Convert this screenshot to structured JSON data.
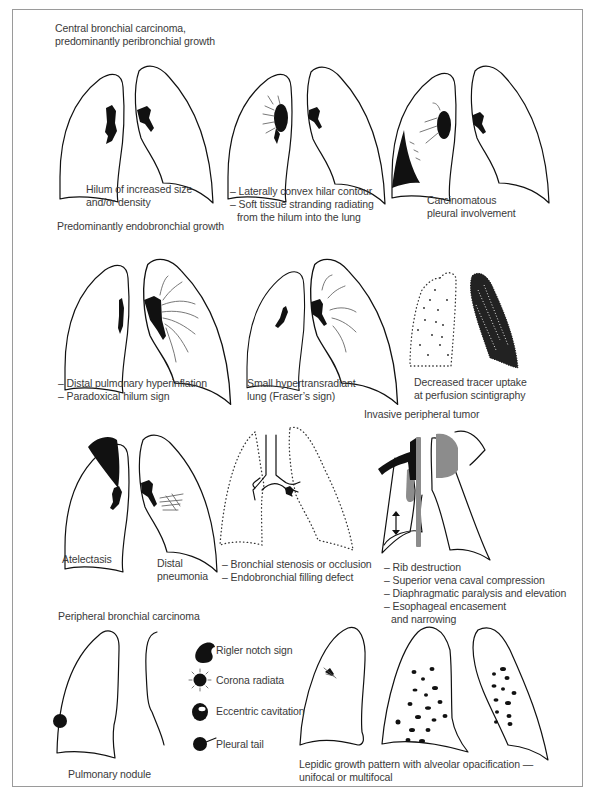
{
  "figure": {
    "sections": {
      "central_title_1": "Central bronchial carcinoma,",
      "central_title_2": "predominantly peribronchial growth",
      "endobronchial_title": "Predominantly endobronchial growth",
      "peripheral_title": "Peripheral bronchial carcinoma",
      "invasive_title": "Invasive peripheral tumor"
    },
    "panels": {
      "hilum": [
        "Hilum of increased size",
        "and/or density"
      ],
      "hilar_contour": [
        "– Laterally convex hilar contour",
        "– Soft tissue stranding radiating",
        "  from the hilum into the lung"
      ],
      "pleural": [
        "Carcinomatous",
        "pleural involvement"
      ],
      "hyperinflation": [
        "– Distal pulmonary hyperinflation",
        "– Paradoxical hilum sign"
      ],
      "fraser": [
        "Small hypertransradiant",
        "lung (Fraser’s sign)"
      ],
      "scintigraphy": [
        "Decreased tracer uptake",
        "at perfusion scintigraphy"
      ],
      "atelectasis": "Atelectasis",
      "pneumonia": [
        "Distal",
        "pneumonia"
      ],
      "bronchial": [
        "– Bronchial stenosis or occlusion",
        "– Endobronchial filling defect"
      ],
      "invasive": [
        "– Rib destruction",
        "– Superior vena caval compression",
        "– Diaphragmatic paralysis and elevation",
        "– Esophageal encasement",
        "  and narrowing"
      ],
      "nodule": "Pulmonary nodule",
      "nodule_signs": [
        "Rigler notch sign",
        "Corona radiata",
        "Eccentric cavitation",
        "Pleural tail"
      ],
      "lepidic": [
        "Lepidic growth pattern with alveolar opacification —",
        "unifocal or multifocal"
      ]
    },
    "colors": {
      "ink": "#111111",
      "tumor_gray": "#8c8c8c",
      "frame": "#9a9a9a",
      "text": "#3a3a3a"
    }
  }
}
